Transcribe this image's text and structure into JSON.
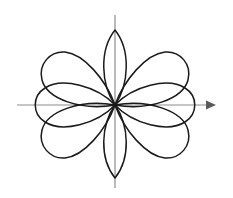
{
  "figure": {
    "background_color": "#ffffff",
    "width": 233,
    "height": 198
  },
  "axes": {
    "origin_x": 115,
    "origin_y": 105,
    "axis_color": "#8c8c8c",
    "arrow_color": "#5a5a5a",
    "x_axis": {
      "label": "x-axis",
      "start_x": 17,
      "end_x": 215,
      "y": 105,
      "has_arrow": true,
      "arrow_direction": "right"
    },
    "y_axis": {
      "label": "y-axis",
      "x": 115,
      "start_y": 15,
      "end_y": 188,
      "has_arrow": false
    }
  },
  "chart_data": {
    "type": "line",
    "subtitle": "",
    "xlabel": "",
    "ylabel": "",
    "coordinate_system": "polar",
    "grid": false,
    "legend": null,
    "xlim": [
      -115,
      118
    ],
    "ylim": [
      -93,
      105
    ],
    "curve_color": "#1a1a1a",
    "curve_width": 1.5,
    "origin": [
      115,
      105
    ],
    "series": [
      {
        "name": "wide-petal-left",
        "equation": "r = a*cos(3*theta)",
        "petal_axis_angle_deg": 180,
        "tip": [
          32,
          105
        ],
        "half_width_px": 40,
        "length_px": 83,
        "shape": "round"
      },
      {
        "name": "wide-petal-right",
        "equation": "r = a*cos(3*theta)",
        "petal_axis_angle_deg": 0,
        "tip": [
          196,
          105
        ],
        "half_width_px": 40,
        "length_px": 81,
        "shape": "round"
      },
      {
        "name": "wide-petal-upper-left",
        "equation": "r = a*cos(3*theta)",
        "petal_axis_angle_deg": 120,
        "tip": [
          73,
          40
        ],
        "half_width_px": 40,
        "length_px": 82,
        "shape": "round"
      },
      {
        "name": "wide-petal-upper-right",
        "equation": "r = a*cos(3*theta)",
        "petal_axis_angle_deg": 60,
        "tip": [
          157,
          40
        ],
        "half_width_px": 40,
        "length_px": 82,
        "shape": "round"
      },
      {
        "name": "wide-petal-lower-left",
        "equation": "r = a*cos(3*theta)",
        "petal_axis_angle_deg": 240,
        "tip": [
          73,
          170
        ],
        "half_width_px": 40,
        "length_px": 82,
        "shape": "round"
      },
      {
        "name": "wide-petal-lower-right",
        "equation": "r = a*cos(3*theta)",
        "petal_axis_angle_deg": 300,
        "tip": [
          157,
          170
        ],
        "half_width_px": 40,
        "length_px": 82,
        "shape": "round"
      },
      {
        "name": "narrow-petal-up",
        "equation": "r = a*cos(3*theta) narrow lobe",
        "petal_axis_angle_deg": 90,
        "tip": [
          115,
          30
        ],
        "half_width_px": 14,
        "length_px": 75,
        "shape": "lens"
      },
      {
        "name": "narrow-petal-down",
        "equation": "r = a*cos(3*theta) narrow lobe",
        "petal_axis_angle_deg": 270,
        "tip": [
          115,
          178
        ],
        "half_width_px": 14,
        "length_px": 73,
        "shape": "lens"
      }
    ],
    "petal_count_wide": 6,
    "petal_count_narrow": 2,
    "petal_count_total": 8
  }
}
